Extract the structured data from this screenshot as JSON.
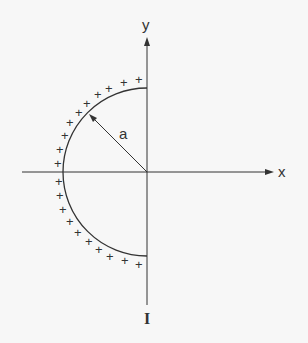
{
  "diagram": {
    "labels": {
      "x_axis": "x",
      "y_axis": "y",
      "radius": "a",
      "current": "I"
    },
    "charge_symbol": "+",
    "charge_count": 20,
    "colors": {
      "line": "#333333",
      "background": "#f7f7f7"
    }
  }
}
